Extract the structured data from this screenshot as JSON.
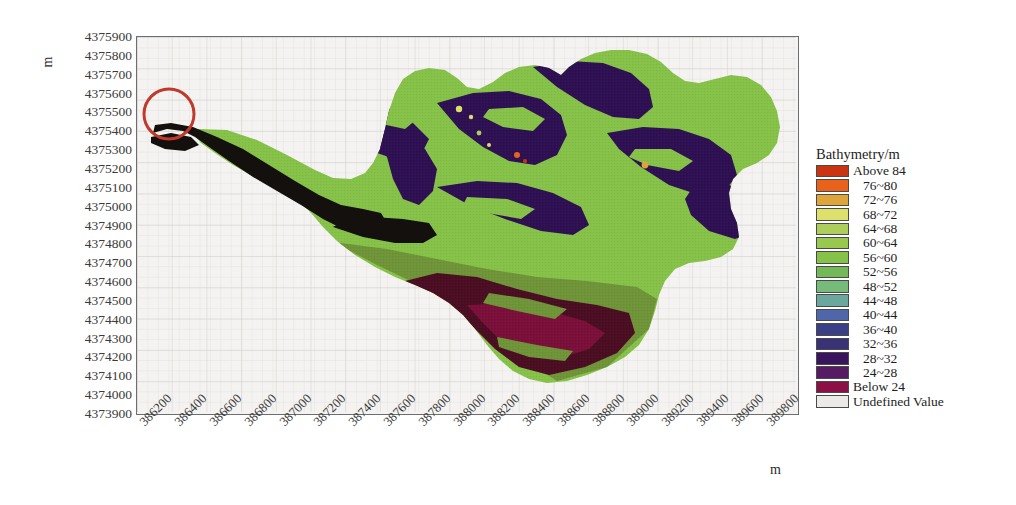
{
  "figure": {
    "type": "bathymetry-contour-map",
    "background_color": "#ffffff",
    "plot_background_color": "#f4f3f1",
    "grid": true,
    "grid_color": "#d9d7d4"
  },
  "axes": {
    "x_unit_label": "m",
    "y_unit_label": "m",
    "x_min": 386100,
    "x_max": 389900,
    "y_min": 4373900,
    "y_max": 4375900,
    "x_tick_labels": [
      "386200",
      "386400",
      "386600",
      "386800",
      "387000",
      "387200",
      "387400",
      "387600",
      "387800",
      "388000",
      "388200",
      "388400",
      "388600",
      "388800",
      "389000",
      "389200",
      "389400",
      "389600",
      "389800"
    ],
    "y_tick_labels": [
      "4375900",
      "4375800",
      "4375700",
      "4375600",
      "4375500",
      "4375400",
      "4375300",
      "4375200",
      "4375100",
      "4375000",
      "4374900",
      "4374800",
      "4374700",
      "4374600",
      "4374500",
      "4374400",
      "4374300",
      "4374200",
      "4374100",
      "4374000",
      "4373900"
    ]
  },
  "legend": {
    "title": "Bathymetry/m",
    "entries": [
      {
        "label": "Above  84",
        "color": "#cc3311",
        "kind": "bound"
      },
      {
        "label": "76~80",
        "color": "#e8621c",
        "kind": "range"
      },
      {
        "label": "72~76",
        "color": "#dfa43a",
        "kind": "range"
      },
      {
        "label": "68~72",
        "color": "#dde06a",
        "kind": "range"
      },
      {
        "label": "64~68",
        "color": "#aece5c",
        "kind": "range"
      },
      {
        "label": "60~64",
        "color": "#96c94e",
        "kind": "range"
      },
      {
        "label": "56~60",
        "color": "#86c248",
        "kind": "range"
      },
      {
        "label": "52~56",
        "color": "#73b957",
        "kind": "range"
      },
      {
        "label": "48~52",
        "color": "#76bb79",
        "kind": "range"
      },
      {
        "label": "44~48",
        "color": "#6aa79c",
        "kind": "range"
      },
      {
        "label": "40~44",
        "color": "#4f67a8",
        "kind": "range"
      },
      {
        "label": "36~40",
        "color": "#3b3f86",
        "kind": "range"
      },
      {
        "label": "32~36",
        "color": "#3a3277",
        "kind": "range"
      },
      {
        "label": "28~32",
        "color": "#38155c",
        "kind": "range"
      },
      {
        "label": "24~28",
        "color": "#561b63",
        "kind": "range"
      },
      {
        "label": "Below  24",
        "color": "#8c1046",
        "kind": "bound"
      },
      {
        "label": "Undefined Value",
        "color": "#eceae6",
        "kind": "bound"
      }
    ]
  },
  "annotations": [
    {
      "name": "inlet-highlight-circle",
      "shape": "circle",
      "color": "#c0392b",
      "cx_px": 168,
      "cy_px": 113,
      "r_px": 25
    }
  ],
  "chart_data": {
    "type": "heatmap",
    "title": "Bathymetry/m",
    "xlabel": "m",
    "ylabel": "m",
    "xlim": [
      386100,
      389900
    ],
    "ylim": [
      4373900,
      4375900
    ],
    "grid": true,
    "legend_position": "right",
    "colorbar_breaks": [
      24,
      28,
      32,
      36,
      40,
      44,
      48,
      52,
      56,
      60,
      64,
      68,
      72,
      76,
      80,
      84
    ],
    "colorbar_colors": [
      "#8c1046",
      "#561b63",
      "#38155c",
      "#3a3277",
      "#3b3f86",
      "#4f67a8",
      "#6aa79c",
      "#76bb79",
      "#73b957",
      "#86c248",
      "#96c94e",
      "#aece5c",
      "#dde06a",
      "#dfa43a",
      "#e8621c",
      "#cc3311"
    ],
    "undefined_color": "#eceae6",
    "regions": [
      {
        "class": "56~60",
        "color": "#86c248",
        "share": 0.42,
        "note": "dominant mid-depth shelf across basin"
      },
      {
        "class": "52~56",
        "color": "#73b957",
        "share": 0.1,
        "note": "olive-green southern shelf"
      },
      {
        "class": "28~32",
        "color": "#38155c",
        "share": 0.22,
        "note": "dark purple deep channels, north and east"
      },
      {
        "class": "Below 24",
        "color": "#8c1046",
        "share": 0.12,
        "note": "deepest maroon pocket, south-central"
      },
      {
        "class": "Below 24",
        "color": "#1a0b0b",
        "share": 0.09,
        "note": "near-black inlet channel, west arm"
      },
      {
        "class": "Above 84",
        "color": "#cc3311",
        "share": 0.01,
        "note": "small red spots near north-central"
      },
      {
        "class": "68~72",
        "color": "#dde06a",
        "share": 0.01,
        "note": "tiny pale spots, north-central islands"
      }
    ]
  }
}
